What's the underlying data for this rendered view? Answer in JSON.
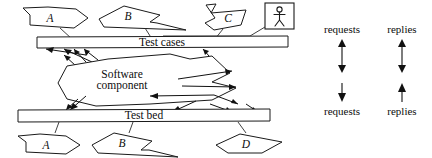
{
  "diagram": {
    "background_color": "#ffffff",
    "stroke_color": "#1a1a1a",
    "bars": [
      {
        "id": "test-cases",
        "label": "Test cases"
      },
      {
        "id": "test-bed",
        "label": "Test bed"
      }
    ],
    "component": {
      "label_line1": "Software",
      "label_line2": "component"
    },
    "actor": {
      "name": "stick-figure-actor"
    },
    "top_nodes": [
      {
        "id": "node-a-top",
        "label": "A"
      },
      {
        "id": "node-b-top",
        "label": "B"
      },
      {
        "id": "node-c-top",
        "label": "C"
      }
    ],
    "bottom_nodes": [
      {
        "id": "node-a-bottom",
        "label": "A"
      },
      {
        "id": "node-b-bottom",
        "label": "B"
      },
      {
        "id": "node-d-bottom",
        "label": "D"
      }
    ],
    "legend": {
      "top": [
        {
          "id": "legend-top-requests",
          "label": "requests",
          "arrow": "double-headed-vertical"
        },
        {
          "id": "legend-top-replies",
          "label": "replies",
          "arrow": "double-headed-vertical"
        }
      ],
      "bottom": [
        {
          "id": "legend-bottom-requests",
          "label": "requests",
          "arrow": "down"
        },
        {
          "id": "legend-bottom-replies",
          "label": "replies",
          "arrow": "up"
        }
      ]
    }
  }
}
